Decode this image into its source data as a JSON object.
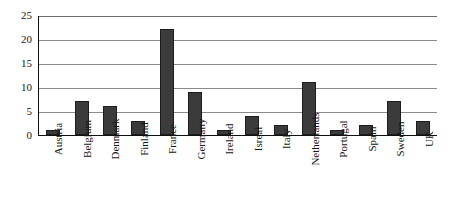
{
  "chart_data": {
    "type": "bar",
    "title": "",
    "subtitle": "",
    "xlabel": "",
    "ylabel": "",
    "categories": [
      "Austria",
      "Belgium",
      "Denmark",
      "Finland",
      "France",
      "Germany",
      "Ireland",
      "Isreal",
      "Italy",
      "Netherlands",
      "Portugal",
      "Spain",
      "Sweden",
      "UK"
    ],
    "values": [
      1,
      7,
      6,
      3,
      22,
      9,
      1,
      4,
      2,
      11,
      1,
      2,
      7,
      3
    ],
    "ylim": [
      0,
      25
    ],
    "yticks": [
      0,
      5,
      10,
      15,
      20,
      25
    ],
    "ytick_labels": [
      "0",
      "5",
      "10",
      "15",
      "20",
      "25"
    ],
    "grid": true,
    "grid_axis": "y",
    "legend": false,
    "legend_position": "none",
    "xtick_rotation": 90,
    "bar_color": "#3b3b3b",
    "bar_edge_color": "#1d1d1d",
    "gridline_color": "#8a8a8a",
    "axis_color": "#101010",
    "background_color": "#ffffff"
  }
}
